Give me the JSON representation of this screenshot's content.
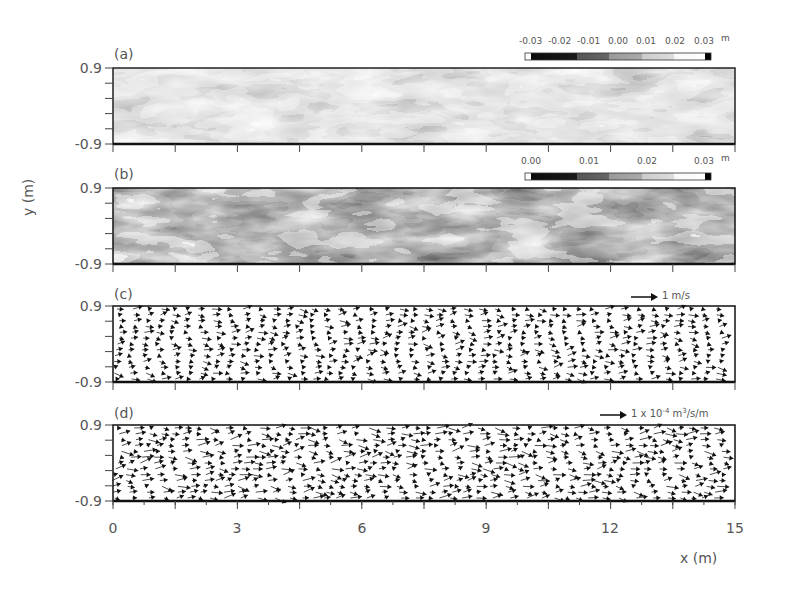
{
  "chart_data": {
    "type": "heatmap",
    "xlabel": "x (m)",
    "ylabel": "y (m)",
    "xlim": [
      0,
      15
    ],
    "ylim": [
      -0.9,
      0.9
    ],
    "x_ticks": [
      "0",
      "3",
      "6",
      "9",
      "12",
      "15"
    ],
    "y_ticks": [
      "0.9",
      "-0.9"
    ],
    "panels": [
      {
        "id": "a",
        "label": "(a)",
        "type": "heatmap",
        "colorbar": {
          "ticks": [
            "-0.03",
            "-0.02",
            "-0.01",
            "0.00",
            "0.01",
            "0.02",
            "0.03"
          ],
          "unit": "m",
          "range": [
            -0.03,
            0.03
          ],
          "colormap": "grayscale (black low to white high)"
        }
      },
      {
        "id": "b",
        "label": "(b)",
        "type": "heatmap",
        "colorbar": {
          "ticks": [
            "0.00",
            "0.01",
            "0.02",
            "0.03"
          ],
          "unit": "m",
          "range": [
            0.0,
            0.03
          ],
          "colormap": "grayscale (black low to white high)"
        }
      },
      {
        "id": "c",
        "label": "(c)",
        "type": "vector",
        "reference_vector": "1 m/s"
      },
      {
        "id": "d",
        "label": "(d)",
        "type": "vector",
        "reference_vector": "1 x 10^-4 m^3/s/m"
      }
    ],
    "grid": false,
    "legend_position": "top-right of each panel (colorbar / reference arrow)"
  },
  "figure": {
    "xlabel": "x (m)",
    "ylabel": "y (m)",
    "x_ticks": [
      "0",
      "3",
      "6",
      "9",
      "12",
      "15"
    ],
    "y_top": "0.9",
    "y_bottom": "-0.9",
    "panels": [
      {
        "label": "(a)",
        "colorbar_ticks": [
          "-0.03",
          "-0.02",
          "-0.01",
          "0.00",
          "0.01",
          "0.02",
          "0.03"
        ],
        "unit": "m"
      },
      {
        "label": "(b)",
        "colorbar_ticks": [
          "0.00",
          "0.01",
          "0.02",
          "0.03"
        ],
        "unit": "m"
      },
      {
        "label": "(c)",
        "ref_text": "1 m/s"
      },
      {
        "label": "(d)",
        "ref_prefix": "1 x 10",
        "ref_exp": "-4",
        "ref_mid": " m",
        "ref_exp2": "3",
        "ref_suffix": "/s/m"
      }
    ]
  }
}
